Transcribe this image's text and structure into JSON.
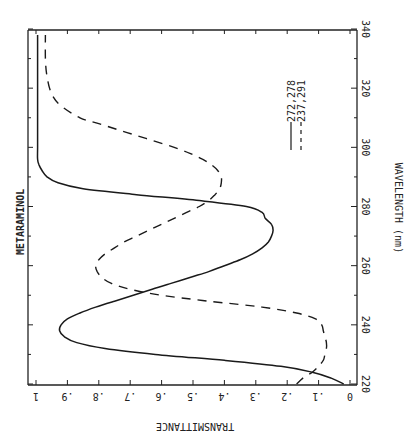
{
  "chart_data": {
    "type": "line",
    "title": "METARAMINOL",
    "xlabel": "WAVELENGTH (nm)",
    "ylabel": "TRANSMITTANCE",
    "orientation": "rotated 90° clockwise (wavelength increases upward along right edge; transmittance increases leftward along bottom)",
    "xlim": [
      220,
      340
    ],
    "ylim": [
      0,
      1
    ],
    "x_ticks": [
      "220",
      "240",
      "260",
      "280",
      "300",
      "320",
      "340"
    ],
    "y_ticks": [
      "0",
      ".1",
      ".2",
      ".3",
      ".4",
      ".5",
      ".6",
      ".7",
      ".8",
      ".9",
      "1"
    ],
    "grid": false,
    "legend": [
      {
        "label": "272,278",
        "style": "solid"
      },
      {
        "label": "237,291",
        "style": "dashed"
      }
    ],
    "series": [
      {
        "name": "272,278",
        "style": "solid",
        "x": [
          220,
          222,
          224,
          226,
          228,
          230,
          232,
          234,
          236,
          238,
          240,
          242,
          244,
          246,
          248,
          250,
          252,
          254,
          256,
          258,
          260,
          262,
          264,
          266,
          268,
          270,
          272,
          274,
          276,
          278,
          280,
          282,
          284,
          286,
          288,
          290,
          292,
          294,
          296,
          300,
          310,
          320,
          330,
          338
        ],
        "y": [
          0.02,
          0.06,
          0.12,
          0.22,
          0.4,
          0.62,
          0.78,
          0.87,
          0.91,
          0.925,
          0.92,
          0.9,
          0.86,
          0.81,
          0.75,
          0.69,
          0.63,
          0.57,
          0.51,
          0.45,
          0.4,
          0.35,
          0.31,
          0.28,
          0.26,
          0.25,
          0.245,
          0.25,
          0.27,
          0.28,
          0.33,
          0.48,
          0.68,
          0.85,
          0.93,
          0.965,
          0.98,
          0.99,
          0.995,
          0.995,
          0.995,
          0.995,
          0.995,
          0.995
        ]
      },
      {
        "name": "237,291",
        "style": "dashed",
        "x": [
          220,
          222,
          224,
          226,
          228,
          230,
          232,
          234,
          236,
          238,
          240,
          242,
          244,
          246,
          248,
          250,
          252,
          254,
          256,
          258,
          260,
          262,
          264,
          266,
          268,
          270,
          272,
          274,
          276,
          278,
          280,
          282,
          284,
          286,
          288,
          290,
          292,
          294,
          296,
          298,
          300,
          302,
          304,
          306,
          308,
          310,
          314,
          318,
          324,
          330,
          338
        ],
        "y": [
          0.17,
          0.15,
          0.12,
          0.1,
          0.085,
          0.08,
          0.075,
          0.075,
          0.08,
          0.085,
          0.09,
          0.11,
          0.17,
          0.28,
          0.45,
          0.6,
          0.7,
          0.76,
          0.79,
          0.805,
          0.81,
          0.8,
          0.78,
          0.75,
          0.72,
          0.68,
          0.64,
          0.6,
          0.56,
          0.52,
          0.48,
          0.45,
          0.43,
          0.415,
          0.41,
          0.41,
          0.42,
          0.44,
          0.47,
          0.51,
          0.56,
          0.62,
          0.68,
          0.74,
          0.8,
          0.86,
          0.92,
          0.95,
          0.965,
          0.97,
          0.97
        ]
      }
    ]
  },
  "labels": {
    "title": "METARAMINOL",
    "x_axis": "WAVELENGTH (nm)",
    "y_axis": "TRANSMITTANCE",
    "legend_solid": "272,278",
    "legend_dash": "237,291"
  }
}
